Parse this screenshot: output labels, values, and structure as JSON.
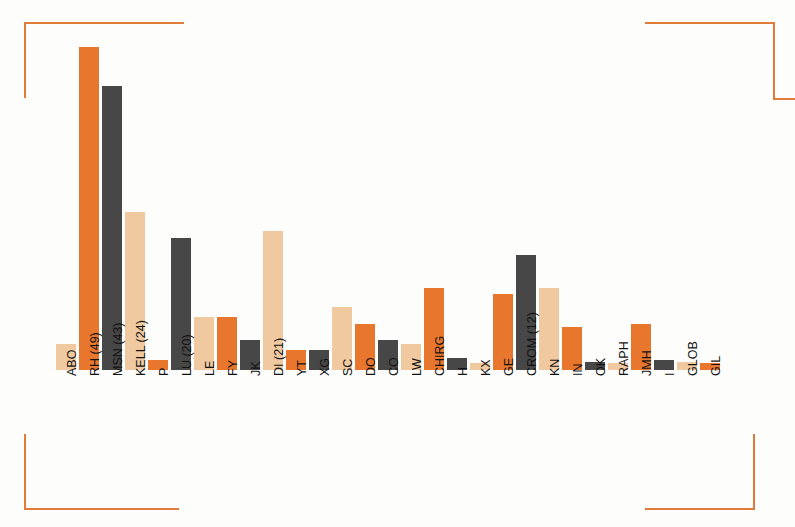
{
  "figure": {
    "background_color": "#fdfdfc",
    "bracket_color": "#e07b3a",
    "palette": {
      "light": "#f0c9a0",
      "orange": "#e8762c",
      "dark": "#474747"
    }
  },
  "chart_data": {
    "type": "bar",
    "title": "",
    "subtitle": "",
    "xlabel": "",
    "ylabel": "",
    "grid": false,
    "legend": null,
    "ylim": [
      0,
      50
    ],
    "categories": [
      "ABO",
      "RH (49)",
      "MSN (43)",
      "KELL (24)",
      "P",
      "LU (20)",
      "LE",
      "FY",
      "JK",
      "DI (21)",
      "YT",
      "XG",
      "SC",
      "DO",
      "CO",
      "LW",
      "CHIRG",
      "H",
      "KX",
      "GE",
      "CROM (12)",
      "KN",
      "IN",
      "OK",
      "RAPH",
      "JMH",
      "I",
      "GLOB",
      "GIL"
    ],
    "values": [
      4,
      49,
      43,
      24,
      1.5,
      20,
      8,
      8,
      4.5,
      21,
      3,
      3,
      9.5,
      7,
      4.5,
      4,
      12.5,
      1.8,
      1,
      11.5,
      17.5,
      12.5,
      6.5,
      1.2,
      1,
      7,
      1.5,
      1.2,
      1
    ],
    "colors": [
      "light",
      "orange",
      "dark",
      "light",
      "orange",
      "dark",
      "light",
      "orange",
      "dark",
      "light",
      "orange",
      "dark",
      "light",
      "orange",
      "dark",
      "light",
      "orange",
      "dark",
      "light",
      "orange",
      "dark",
      "light",
      "orange",
      "dark",
      "light",
      "orange",
      "dark",
      "light",
      "orange"
    ]
  }
}
